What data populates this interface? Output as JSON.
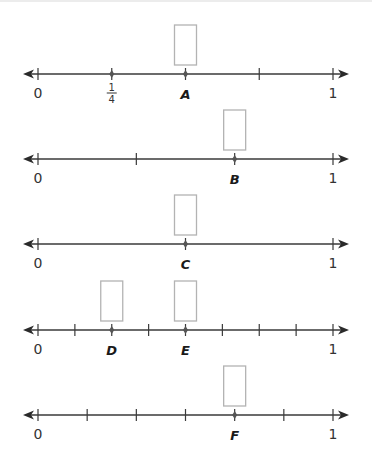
{
  "number_lines": [
    {
      "id": "line-1",
      "start_label": "0",
      "end_label": "1",
      "denominator": 4,
      "tick_fractions": [
        "0",
        "1/4",
        "2/4",
        "3/4",
        "1"
      ],
      "labeled_tick": {
        "index": 1,
        "numerator": "1",
        "denominator": "4"
      },
      "points": [
        {
          "letter": "A",
          "index": 2,
          "answer_box": true
        }
      ],
      "dots_at": [
        1,
        2
      ]
    },
    {
      "id": "line-2",
      "start_label": "0",
      "end_label": "1",
      "denominator": 3,
      "tick_fractions": [
        "0",
        "1/3",
        "2/3",
        "1"
      ],
      "points": [
        {
          "letter": "B",
          "index": 2,
          "answer_box": true
        }
      ],
      "dots_at": [
        2
      ]
    },
    {
      "id": "line-3",
      "start_label": "0",
      "end_label": "1",
      "denominator": 2,
      "tick_fractions": [
        "0",
        "1/2",
        "1"
      ],
      "points": [
        {
          "letter": "C",
          "index": 1,
          "answer_box": true
        }
      ],
      "dots_at": [
        1
      ]
    },
    {
      "id": "line-4",
      "start_label": "0",
      "end_label": "1",
      "denominator": 8,
      "tick_fractions": [
        "0",
        "1/8",
        "2/8",
        "3/8",
        "4/8",
        "5/8",
        "6/8",
        "7/8",
        "1"
      ],
      "points": [
        {
          "letter": "D",
          "index": 2,
          "answer_box": true
        },
        {
          "letter": "E",
          "index": 4,
          "answer_box": true
        }
      ],
      "dots_at": [
        2,
        4
      ]
    },
    {
      "id": "line-5",
      "start_label": "0",
      "end_label": "1",
      "denominator": 6,
      "tick_fractions": [
        "0",
        "1/6",
        "2/6",
        "3/6",
        "4/6",
        "5/6",
        "1"
      ],
      "points": [
        {
          "letter": "F",
          "index": 4,
          "answer_box": true
        }
      ],
      "dots_at": [
        4
      ]
    }
  ],
  "colors": {
    "axis": "#3a3a3a",
    "box_border": "#b3b3b3",
    "dot": "#555555",
    "text": "#333333"
  }
}
